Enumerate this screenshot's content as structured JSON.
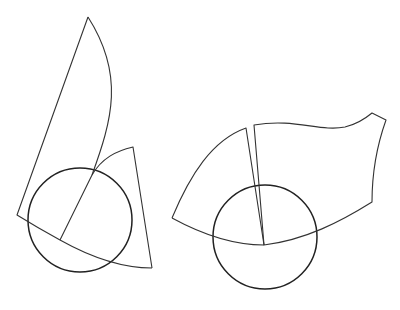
{
  "diagram": {
    "colors": {
      "background": "#ffffff",
      "stroke": "#333333",
      "circle_stroke": "#222222"
    },
    "figures": [
      {
        "id": "left-figure",
        "circle": {
          "cx": 80,
          "cy": 220,
          "r": 52
        },
        "shapes": [
          {
            "name": "tall-sector",
            "path": "M88,17 L17,215 Q38,228 60,240 Q110,268 152,268"
          },
          {
            "name": "tall-sector-arc",
            "path": "M88,17 C125,75 112,120 92,175 L60,240"
          },
          {
            "name": "small-wedge",
            "path": "M92,175 C102,158 116,151 133,147 L152,268"
          }
        ]
      },
      {
        "id": "right-figure",
        "circle": {
          "cx": 265,
          "cy": 237,
          "r": 52
        },
        "shapes": [
          {
            "name": "left-sector",
            "path": "M172,218 C190,175 212,140 246,128 L264,245"
          },
          {
            "name": "flag-sector",
            "path": "M254,125 C295,118 320,132 345,127 C358,124 366,118 372,113 L386,120 C376,148 372,172 372,202 L372,202 C340,222 305,240 264,245 Z"
          },
          {
            "name": "bottom-arc",
            "path": "M172,218 C205,236 234,245 264,245"
          }
        ]
      }
    ]
  }
}
